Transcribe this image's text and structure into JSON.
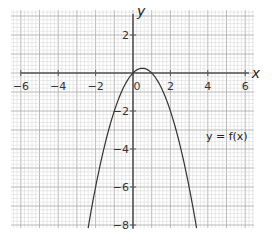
{
  "chart_data": {
    "type": "line",
    "title": "",
    "xlabel": "x",
    "ylabel": "y",
    "xlim": [
      -6.3,
      6.3
    ],
    "ylim": [
      -8.2,
      3.3
    ],
    "grid": true,
    "x_ticks": [
      -6,
      -4,
      -2,
      0,
      2,
      4,
      6
    ],
    "x_tick_labels": [
      "−6",
      "−4",
      "−2",
      "0",
      "2",
      "4",
      "6"
    ],
    "y_ticks": [
      2,
      -2,
      -4,
      -6,
      -8
    ],
    "y_tick_labels": [
      "2",
      "−2",
      "−4",
      "−6",
      "−8"
    ],
    "series": [
      {
        "name": "y = f(x)",
        "function": "f(x) = x - x^2",
        "x": [
          -2.4,
          -2,
          -1.5,
          -1,
          -0.5,
          0,
          0.5,
          1,
          1.5,
          2,
          2.5,
          3,
          3.4
        ],
        "y": [
          -8.16,
          -6,
          -3.75,
          -2,
          -0.75,
          0,
          0.25,
          0,
          -0.75,
          -2,
          -3.75,
          -6,
          -8.16
        ]
      }
    ],
    "annotations": [
      {
        "text": "y = f(x)",
        "x": 3.9,
        "y": -3.5
      }
    ],
    "colors": {
      "grid_minor": "#d4d4d4",
      "grid_major": "#a8a8a8",
      "axis": "#555555",
      "curve": "#333333"
    }
  }
}
